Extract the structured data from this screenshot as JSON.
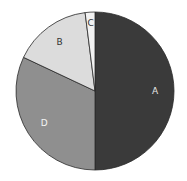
{
  "chart_data": {
    "type": "pie",
    "title": "",
    "start_angle_deg": 0,
    "direction": "clockwise",
    "legend": "none",
    "slices": [
      {
        "label": "A",
        "value": 50,
        "color": "#3a3a3a",
        "label_color": "#e8e8e8"
      },
      {
        "label": "D",
        "value": 32,
        "color": "#8f8f8f",
        "label_color": "#f4f4f4"
      },
      {
        "label": "B",
        "value": 16,
        "color": "#dcdcdc",
        "label_color": "#333333"
      },
      {
        "label": "C",
        "value": 2,
        "color": "#f2f2f2",
        "label_color": "#333333"
      }
    ],
    "categories": [
      "A",
      "D",
      "B",
      "C"
    ],
    "values": [
      50,
      32,
      16,
      2
    ]
  },
  "geometry": {
    "cx": 95,
    "cy": 91,
    "r": 79
  }
}
